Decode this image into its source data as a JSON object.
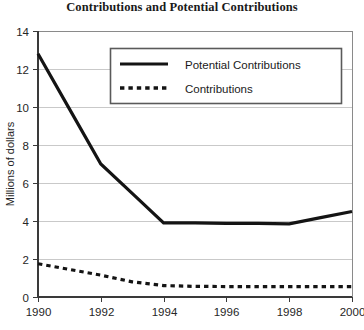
{
  "chart_data": {
    "type": "line",
    "title": "Contributions and Potential Contributions",
    "xlabel": "",
    "ylabel": "Millions of dollars",
    "x": [
      1990,
      1991,
      1992,
      1993,
      1994,
      1995,
      1996,
      1997,
      1998,
      1999,
      2000
    ],
    "xticks": [
      "1990",
      "1992",
      "1994",
      "1996",
      "1998",
      "2000"
    ],
    "xtick_values": [
      1990,
      1992,
      1994,
      1996,
      1998,
      2000
    ],
    "yticks": [
      "0",
      "2",
      "4",
      "6",
      "8",
      "10",
      "12",
      "14"
    ],
    "ytick_values": [
      0,
      2,
      4,
      6,
      8,
      10,
      12,
      14
    ],
    "xlim": [
      1990,
      2000
    ],
    "ylim": [
      0,
      14
    ],
    "grid": true,
    "grid_axis": "y",
    "legend_position": "upper center",
    "series": [
      {
        "name": "Potential Contributions",
        "style": "solid",
        "color": "#141414",
        "values": [
          12.8,
          9.9,
          7.0,
          5.45,
          3.9,
          3.9,
          3.88,
          3.87,
          3.85,
          4.18,
          4.5
        ]
      },
      {
        "name": "Contributions",
        "style": "dotted",
        "color": "#141414",
        "values": [
          1.75,
          1.45,
          1.15,
          0.8,
          0.6,
          0.56,
          0.55,
          0.55,
          0.55,
          0.55,
          0.55
        ]
      }
    ]
  },
  "legend": {
    "entries": [
      {
        "label": "Potential Contributions"
      },
      {
        "label": "Contributions"
      }
    ]
  },
  "axes": {
    "y_title": "Millions of dollars"
  }
}
